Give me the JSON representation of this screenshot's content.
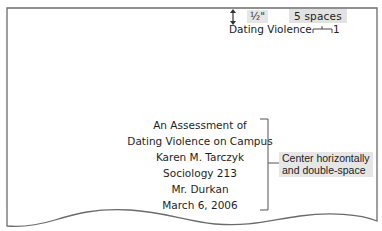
{
  "annotations": {
    "top_margin": "½\"",
    "indent": "5 spaces",
    "title_note": [
      "Center horizontally",
      "and double-space"
    ]
  },
  "header": {
    "running_head": "Dating Violence",
    "page_number": "1"
  },
  "title_page": {
    "lines": [
      "An Assessment of",
      "Dating Violence on Campus",
      "Karen M. Tarczyk",
      "Sociology 213",
      "Mr. Durkan",
      "March 6, 2006"
    ]
  },
  "icons": {
    "margin_arrow": "up-down-arrow-icon",
    "space_marker": "bracket-gap-icon"
  },
  "colors": {
    "page_border": "#6b6b6b",
    "label_bg": "#e4e4e4",
    "text": "#1e1e1e"
  }
}
